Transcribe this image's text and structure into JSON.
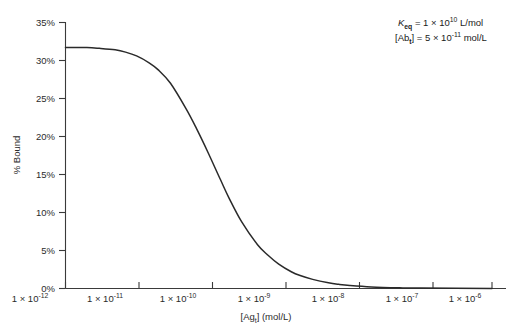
{
  "chart_data": {
    "type": "line",
    "title": "",
    "xlabel": "[Ag_t] (mol/L)",
    "ylabel": "% Bound",
    "xscale": "log",
    "xlim": [
      1e-12,
      1e-06
    ],
    "ylim": [
      0,
      35
    ],
    "grid": false,
    "legend": null,
    "x_tick_labels": [
      "1 × 10-12",
      "1 × 10-11",
      "1 × 10-10",
      "1 × 10-9",
      "1 × 10-8",
      "1 × 10-7",
      "1 × 10-6"
    ],
    "x_tick_mantissa": "1 × 10",
    "x_tick_exponents": [
      "-12",
      "-11",
      "-10",
      "-9",
      "-8",
      "-7",
      "-6"
    ],
    "y_tick_labels": [
      "0%",
      "5%",
      "10%",
      "15%",
      "20%",
      "25%",
      "30%",
      "35%"
    ],
    "y_tick_values": [
      0,
      5,
      10,
      15,
      20,
      25,
      30,
      35
    ],
    "series": [
      {
        "name": "% Bound",
        "x": [
          1e-12,
          2e-12,
          3e-12,
          5e-12,
          7e-12,
          1e-11,
          1.5e-11,
          2e-11,
          3e-11,
          5e-11,
          7e-11,
          1e-10,
          1.5e-10,
          2e-10,
          3e-10,
          5e-10,
          7e-10,
          1e-09,
          1.5e-09,
          2e-09,
          3e-09,
          5e-09,
          7e-09,
          1e-08,
          2e-08,
          5e-08,
          1e-07,
          1e-06
        ],
        "values": [
          31.7,
          31.7,
          31.6,
          31.4,
          31.1,
          30.6,
          29.7,
          28.8,
          27.0,
          23.6,
          21.0,
          18.0,
          14.4,
          11.9,
          8.8,
          5.8,
          4.4,
          3.2,
          2.2,
          1.7,
          1.2,
          0.75,
          0.55,
          0.4,
          0.21,
          0.09,
          0.05,
          0.01
        ]
      }
    ],
    "annotations": [
      {
        "id": "keq",
        "text": "Keq = 1 × 1010 L/mol",
        "symbol": "K",
        "symbol_sub": "eq",
        "equals": " = 1 × 10",
        "exponent": "10",
        "unit": " L/mol"
      },
      {
        "id": "abt",
        "text": "[Abt] = 5 × 10-11 mol/L",
        "symbol": "[Ab",
        "symbol_sub": "t",
        "equals": "] = 5 × 10",
        "exponent": "-11",
        "unit": " mol/L"
      }
    ],
    "xlabel_parts": {
      "prefix": "[Ag",
      "sub": "t",
      "suffix": "] (mol/L)"
    },
    "colors": {
      "curve": "#2a2a2a",
      "axis": "#3a3a3a",
      "text": "#1a1a1a",
      "background": "#ffffff"
    }
  }
}
